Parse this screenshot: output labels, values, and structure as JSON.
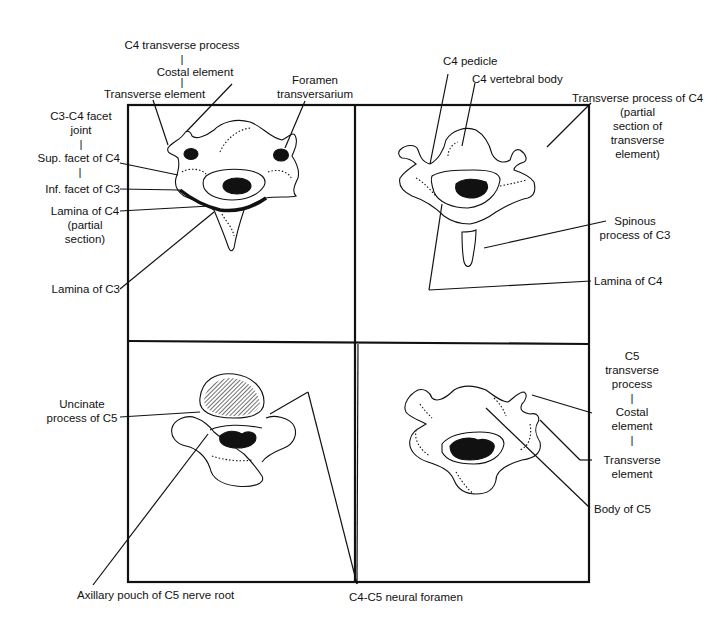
{
  "figure": {
    "panels": [
      {
        "id": "top-left",
        "view": "C3-C4 facet joint level"
      },
      {
        "id": "top-right",
        "view": "C4 pedicle level"
      },
      {
        "id": "bottom-left",
        "view": "C4-C5 disc / uncinate level"
      },
      {
        "id": "bottom-right",
        "view": "C5 vertebral body level"
      }
    ]
  },
  "labels": {
    "c4_transverse_process": "C4 transverse process",
    "sep1": "|",
    "costal_element": "Costal element",
    "sep2": "|",
    "transverse_element": "Transverse element",
    "foramen_l1": "Foramen",
    "foramen_l2": "transversarium",
    "facet_joint_l1": "C3-C4 facet",
    "facet_joint_l2": "joint",
    "sep3": "|",
    "sup_facet": "Sup. facet of C4",
    "sep4": "|",
    "inf_facet": "Inf. facet of C3",
    "lamina_c4_l1": "Lamina of C4",
    "lamina_c4_l2": "(partial",
    "lamina_c4_l3": "section)",
    "lamina_c3": "Lamina of C3",
    "c4_pedicle": "C4 pedicle",
    "c4_vertebral_body": "C4 vertebral body",
    "tp_c4_l1": "Transverse process of C4",
    "tp_c4_l2": "(partial",
    "tp_c4_l3": "section of",
    "tp_c4_l4": "transverse",
    "tp_c4_l5": "element)",
    "spinous_l1": "Spinous",
    "spinous_l2": "process of C3",
    "lamina_c4_right": "Lamina of C4",
    "uncinate_l1": "Uncinate",
    "uncinate_l2": "process of C5",
    "c5_tp_l1": "C5",
    "c5_tp_l2": "transverse",
    "c5_tp_l3": "process",
    "sep5": "|",
    "c5_costal_l1": "Costal",
    "c5_costal_l2": "element",
    "sep6": "|",
    "c5_transverse_l1": "Transverse",
    "c5_transverse_l2": "element",
    "body_c5": "Body of C5",
    "axillary_pouch": "Axillary pouch of C5 nerve root",
    "neural_foramen": "C4-C5 neural foramen"
  },
  "colors": {
    "line": "#111111",
    "background": "#ffffff"
  }
}
